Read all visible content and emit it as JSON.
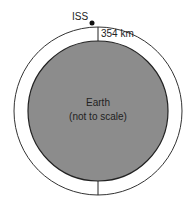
{
  "diagram": {
    "satellite_label": "ISS",
    "altitude_label": "354 km",
    "earth_label_line1": "Earth",
    "earth_label_line2": "(not to scale)",
    "colors": {
      "earth_fill": "#8c8c8c",
      "orbit_stroke": "#333333",
      "background": "#ffffff"
    }
  }
}
